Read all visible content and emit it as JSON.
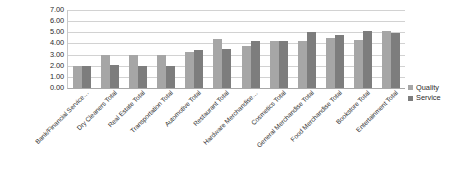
{
  "chart_data": {
    "type": "bar",
    "title": "",
    "xlabel": "",
    "ylabel": "",
    "ylim": [
      0,
      7
    ],
    "ytick_labels": [
      "7.00",
      "6.00",
      "5.00",
      "4.00",
      "3.00",
      "2.00",
      "1.00",
      "0.00"
    ],
    "ytick_values": [
      7,
      6,
      5,
      4,
      3,
      2,
      1,
      0
    ],
    "grid": true,
    "legend_position": "right",
    "categories": [
      "Bank/Financial Service…",
      "Dry Cleaners Total",
      "Real Estate Total",
      "Transportation Total",
      "Automotive Total",
      "Restaurant Total",
      "Hardware Merchandise…",
      "Cosmetics Total",
      "General Merchandise Total",
      "Food Merchandise Total",
      "Bookstore Total",
      "Entertainment Total"
    ],
    "series": [
      {
        "name": "Quality",
        "color": "#a6a6a6",
        "values": [
          2.0,
          3.0,
          3.0,
          3.0,
          3.2,
          4.4,
          3.8,
          4.2,
          4.2,
          4.5,
          4.3,
          5.1
        ]
      },
      {
        "name": "Service",
        "color": "#7d7d7d",
        "values": [
          2.0,
          2.1,
          2.0,
          2.0,
          3.4,
          3.5,
          4.2,
          4.2,
          5.0,
          4.8,
          5.1,
          4.9
        ]
      }
    ]
  },
  "legend": {
    "items": [
      {
        "label": "Quality",
        "swatch": "quality"
      },
      {
        "label": "Service",
        "swatch": "service"
      }
    ]
  }
}
